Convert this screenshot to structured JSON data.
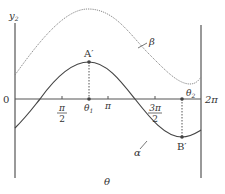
{
  "diagram": {
    "type": "function-graph",
    "axis_labels": {
      "y": "y",
      "y_sub": "2",
      "x": "θ",
      "origin": "0",
      "end": "2π"
    },
    "ticks": [
      {
        "name": "pi-over-2",
        "num": "π",
        "den": "2"
      },
      {
        "name": "pi",
        "label": "π"
      },
      {
        "name": "three-pi-over-2",
        "num": "3π",
        "den": "2"
      }
    ],
    "markers": {
      "theta1": {
        "label": "θ",
        "sub": "1"
      },
      "theta2": {
        "label": "θ",
        "sub": "2"
      }
    },
    "points": {
      "A": {
        "label": "A′"
      },
      "B": {
        "label": "B′"
      }
    },
    "curves": {
      "alpha": {
        "label": "α",
        "style": "solid"
      },
      "beta": {
        "label": "β",
        "style": "dotted"
      }
    },
    "colors": {
      "axis": "#555555",
      "alpha": "#444444",
      "beta": "#888888",
      "text": "#333333"
    }
  }
}
